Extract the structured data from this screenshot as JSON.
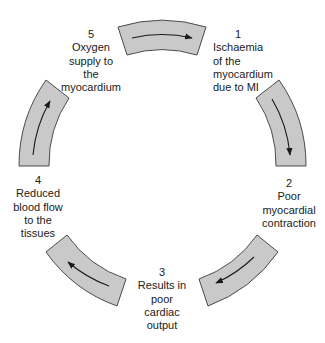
{
  "diagram": {
    "type": "cycle",
    "direction": "clockwise",
    "fill_color": "#c9c9c9",
    "stroke_color": "#4a4a4a",
    "steps": [
      {
        "number": "1",
        "lines": [
          "Ischaemia",
          "of the",
          "myocardium",
          "due to MI"
        ]
      },
      {
        "number": "2",
        "lines": [
          "Poor",
          "myocardial",
          "contraction"
        ]
      },
      {
        "number": "3",
        "lines": [
          "Results in",
          "poor",
          "cardiac",
          "output"
        ]
      },
      {
        "number": "4",
        "lines": [
          "Reduced",
          "blood flow",
          "to the",
          "tissues"
        ]
      },
      {
        "number": "5",
        "lines": [
          "Oxygen",
          "supply to",
          "the",
          "myocardium"
        ]
      }
    ],
    "arrows": [
      {
        "from": "5",
        "to": "1",
        "icon": "curved-arrow-right"
      },
      {
        "from": "1",
        "to": "2",
        "icon": "curved-arrow-down"
      },
      {
        "from": "2",
        "to": "3",
        "icon": "curved-arrow-down-left"
      },
      {
        "from": "3",
        "to": "4",
        "icon": "curved-arrow-up-left"
      },
      {
        "from": "4",
        "to": "5",
        "icon": "curved-arrow-up"
      }
    ]
  }
}
